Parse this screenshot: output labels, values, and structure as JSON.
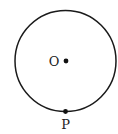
{
  "diagram": {
    "type": "circle-geometry",
    "circle": {
      "cx": 65.5,
      "cy": 61,
      "r": 50.5,
      "stroke": "#1a1a1a",
      "stroke_width": 1.5
    },
    "points": [
      {
        "id": "O",
        "label": "O",
        "x": 66,
        "y": 61,
        "label_x": 54,
        "label_y": 65.5,
        "role": "center"
      },
      {
        "id": "P",
        "label": "P",
        "x": 65.5,
        "y": 111.5,
        "label_x": 65.5,
        "label_y": 129,
        "role": "on-circle"
      }
    ],
    "colors": {
      "line": "#1a1a1a",
      "point": "#111111",
      "text": "#222222",
      "background": "#ffffff"
    }
  }
}
